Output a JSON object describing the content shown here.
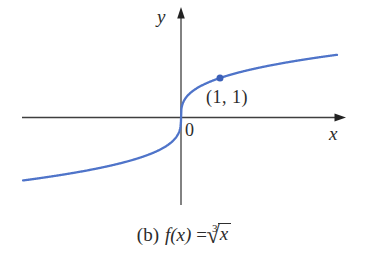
{
  "figure": {
    "axes": {
      "x_label": "x",
      "y_label": "y",
      "origin_label": "0"
    },
    "point_label": "(1, 1)",
    "caption": {
      "prefix": "(b)",
      "function": "f(x)",
      "equals": "=",
      "root_index": "3",
      "radical_glyph": "√",
      "radicand": "x"
    },
    "colors": {
      "curve": "#4f74c9",
      "point": "#3c60b8",
      "axis": "#3f3f3f",
      "arrow": "#222222",
      "text": "#2b2b2b",
      "background": "#ffffff"
    }
  },
  "chart_data": {
    "type": "line",
    "xlabel": "x",
    "ylabel": "y",
    "function": "f(x) = x^(1/3)",
    "x_range": [
      -4.05,
      4.0
    ],
    "y_range": [
      -1.6,
      1.6
    ],
    "series": [
      {
        "name": "f(x) = ∛x",
        "x": [
          -4,
          -3,
          -2,
          -1,
          0,
          1,
          2,
          3,
          4
        ],
        "y": [
          -1.587,
          -1.442,
          -1.26,
          -1,
          0,
          1,
          1.26,
          1.442,
          1.587
        ]
      }
    ],
    "marked_points": [
      {
        "x": 1,
        "y": 1,
        "label": "(1, 1)"
      }
    ],
    "grid": false,
    "legend": false,
    "axis_arrows": {
      "x": "right",
      "y": "top"
    },
    "origin_label": "0"
  }
}
